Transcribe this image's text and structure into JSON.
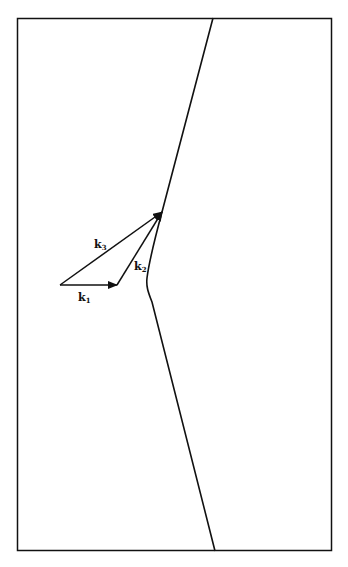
{
  "diagram": {
    "vectors": [
      {
        "name": "k1",
        "label": "k",
        "subscript": "1",
        "from": [
          60,
          285
        ],
        "to": [
          117,
          285
        ]
      },
      {
        "name": "k2",
        "label": "k",
        "subscript": "2",
        "from": [
          117,
          285
        ],
        "to": [
          162,
          212
        ]
      },
      {
        "name": "k3",
        "label": "k",
        "subscript": "3",
        "from": [
          60,
          285
        ],
        "to": [
          162,
          212
        ]
      }
    ],
    "boundary_curve": "bent line with apex near left-center",
    "colors": {
      "line": "#111111",
      "background": "#ffffff"
    }
  }
}
